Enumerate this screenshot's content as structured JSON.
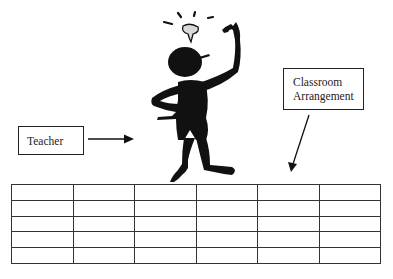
{
  "diagram": {
    "labels": {
      "teacher": "Teacher",
      "classroom_line1": "Classroom",
      "classroom_line2": "Arrangement"
    },
    "figure": {
      "description": "black silhouette stick figure with raised finger and light bulb above head"
    },
    "grid": {
      "rows": 5,
      "columns": 6
    },
    "colors": {
      "ink": "#111111",
      "bulb": "#d9d9d9",
      "background": "#ffffff"
    }
  }
}
